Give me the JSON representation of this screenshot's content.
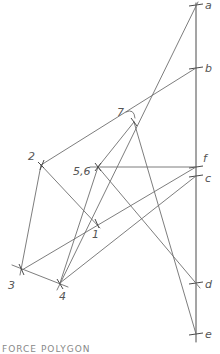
{
  "diagram": {
    "type": "force polygon / funicular construction (hand-drawn)",
    "caption": "FORCE POLYGON",
    "load_line": {
      "label_points": [
        {
          "id": "a",
          "label": "a",
          "x": 196,
          "y": 5
        },
        {
          "id": "b",
          "label": "b",
          "x": 196,
          "y": 68
        },
        {
          "id": "f",
          "label": "f",
          "x": 196,
          "y": 167
        },
        {
          "id": "c",
          "label": "c",
          "x": 196,
          "y": 176
        },
        {
          "id": "d",
          "label": "d",
          "x": 196,
          "y": 283
        },
        {
          "id": "e",
          "label": "e",
          "x": 196,
          "y": 334
        }
      ]
    },
    "nodes": [
      {
        "id": "1",
        "label": "1",
        "x": 96,
        "y": 223
      },
      {
        "id": "2",
        "label": "2",
        "x": 41,
        "y": 165
      },
      {
        "id": "3",
        "label": "3",
        "x": 22,
        "y": 270
      },
      {
        "id": "4",
        "label": "4",
        "x": 60,
        "y": 283
      },
      {
        "id": "5,6",
        "label": "5,6",
        "x": 98,
        "y": 167
      },
      {
        "id": "7",
        "label": "7",
        "x": 134,
        "y": 122
      }
    ]
  }
}
